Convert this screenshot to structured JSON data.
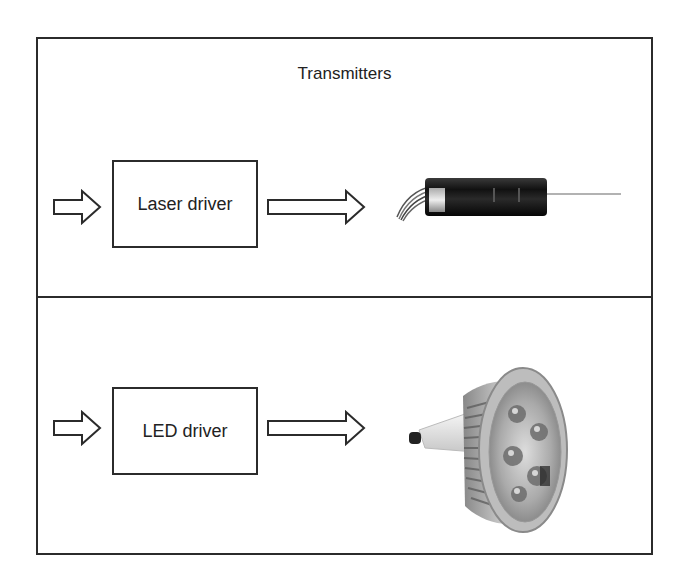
{
  "title": "Transmitters",
  "sections": [
    {
      "name": "laser",
      "driver_label": "Laser driver",
      "device": "laser-diode-module"
    },
    {
      "name": "led",
      "driver_label": "LED driver",
      "device": "led-spot-bulb"
    }
  ],
  "colors": {
    "stroke": "#2b2b2b",
    "background": "#ffffff",
    "text": "#222222"
  }
}
